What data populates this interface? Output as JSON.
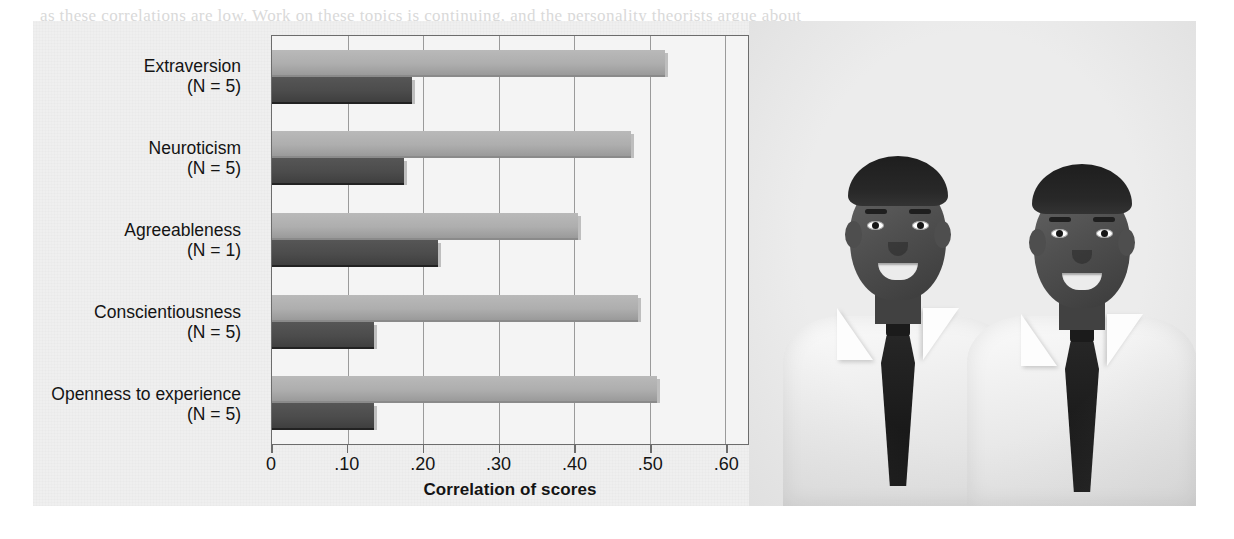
{
  "figure": {
    "credit_left": "© Cengage Learning 2013",
    "credit_right": "© Image Source/Alamy",
    "background_color": "#efefef"
  },
  "legend": {
    "position": "top-right",
    "items": [
      {
        "label": "Identical twins",
        "color": "#a8a8a8",
        "key": "identical"
      },
      {
        "label": "Fraternal twins",
        "color": "#4a4a4a",
        "key": "fraternal"
      }
    ]
  },
  "photo": {
    "alt": "Two identical twin young men in white dress shirts and dark neckties, smiling",
    "subjects": 2,
    "style": "black-and-white photograph"
  },
  "bleed_text": [
    {
      "text": "as these correlations are low. Work on these topics is continuing, and the personality theorists argue about",
      "x": 40,
      "y": 6
    },
    {
      "text": "possible explanations. As the same as the subtleties and some predictors of complex learning and practice, for",
      "x": 40,
      "y": 30
    },
    {
      "text": "it the specific genes really took root and took the ones that predict the heritable traits and the overall contexts",
      "x": 40,
      "y": 54
    },
    {
      "text": "transform findings between studies. The difference is that the results of the two twin types from people",
      "x": 40,
      "y": 78
    },
    {
      "text": "obtain as we see in correlational studies.",
      "x": 40,
      "y": 102
    },
    {
      "text": "other is that after we look at the personality studies showing the failure of the non-shared experience",
      "x": 40,
      "y": 130
    },
    {
      "text": "that may be shaped by multiple traits of the twins as well. Why we will make sure the behavior of twins",
      "x": 40,
      "y": 158
    },
    {
      "text": "however, also study small effects of one another, these studies argue that different differences in our own",
      "x": 40,
      "y": 186
    },
    {
      "text": "of the behavior, and they are small and still different in the studies as relatively more shared changes",
      "x": 40,
      "y": 214
    },
    {
      "text": "that do not always show any effect in the interpretation of our shared and non-shared people of the",
      "x": 40,
      "y": 242
    },
    {
      "text": "twin studies and in the personality as well. Another difference is what happens with studies around a critical",
      "x": 40,
      "y": 268
    },
    {
      "text": "and the twins and the same as what enable producing adolescents.",
      "x": 40,
      "y": 296
    },
    {
      "text": "differences in the larger study as well. However, it is the way our differences can change across time",
      "x": 40,
      "y": 322
    },
    {
      "text": "the same as the others that may be considered as well. The personality of the variability is one that",
      "x": 40,
      "y": 348
    },
    {
      "text": "and stress, or body, and to be identified in the more specific and sensitivity to environment.",
      "x": 40,
      "y": 374
    }
  ],
  "chart_data": {
    "type": "bar",
    "orientation": "horizontal",
    "title": "",
    "xlabel": "Correlation of scores",
    "ylabel": "",
    "xlim": [
      0,
      0.63
    ],
    "xticks": [
      0,
      0.1,
      0.2,
      0.3,
      0.4,
      0.5,
      0.6
    ],
    "xticklabels": [
      "0",
      ".10",
      ".20",
      ".30",
      ".40",
      ".50",
      ".60"
    ],
    "grid": "vertical",
    "legend_position": "top-right",
    "categories": [
      "Extraversion",
      "Neuroticism",
      "Agreeableness",
      "Conscientiousness",
      "Openness to experience"
    ],
    "category_sublabels": [
      "(N = 5)",
      "(N = 5)",
      "(N = 1)",
      "(N = 5)",
      "(N = 5)"
    ],
    "series": [
      {
        "name": "Identical twins",
        "color": "#a8a8a8",
        "values": [
          0.52,
          0.475,
          0.405,
          0.485,
          0.51
        ]
      },
      {
        "name": "Fraternal twins",
        "color": "#4a4a4a",
        "values": [
          0.185,
          0.175,
          0.22,
          0.135,
          0.135
        ]
      }
    ]
  }
}
